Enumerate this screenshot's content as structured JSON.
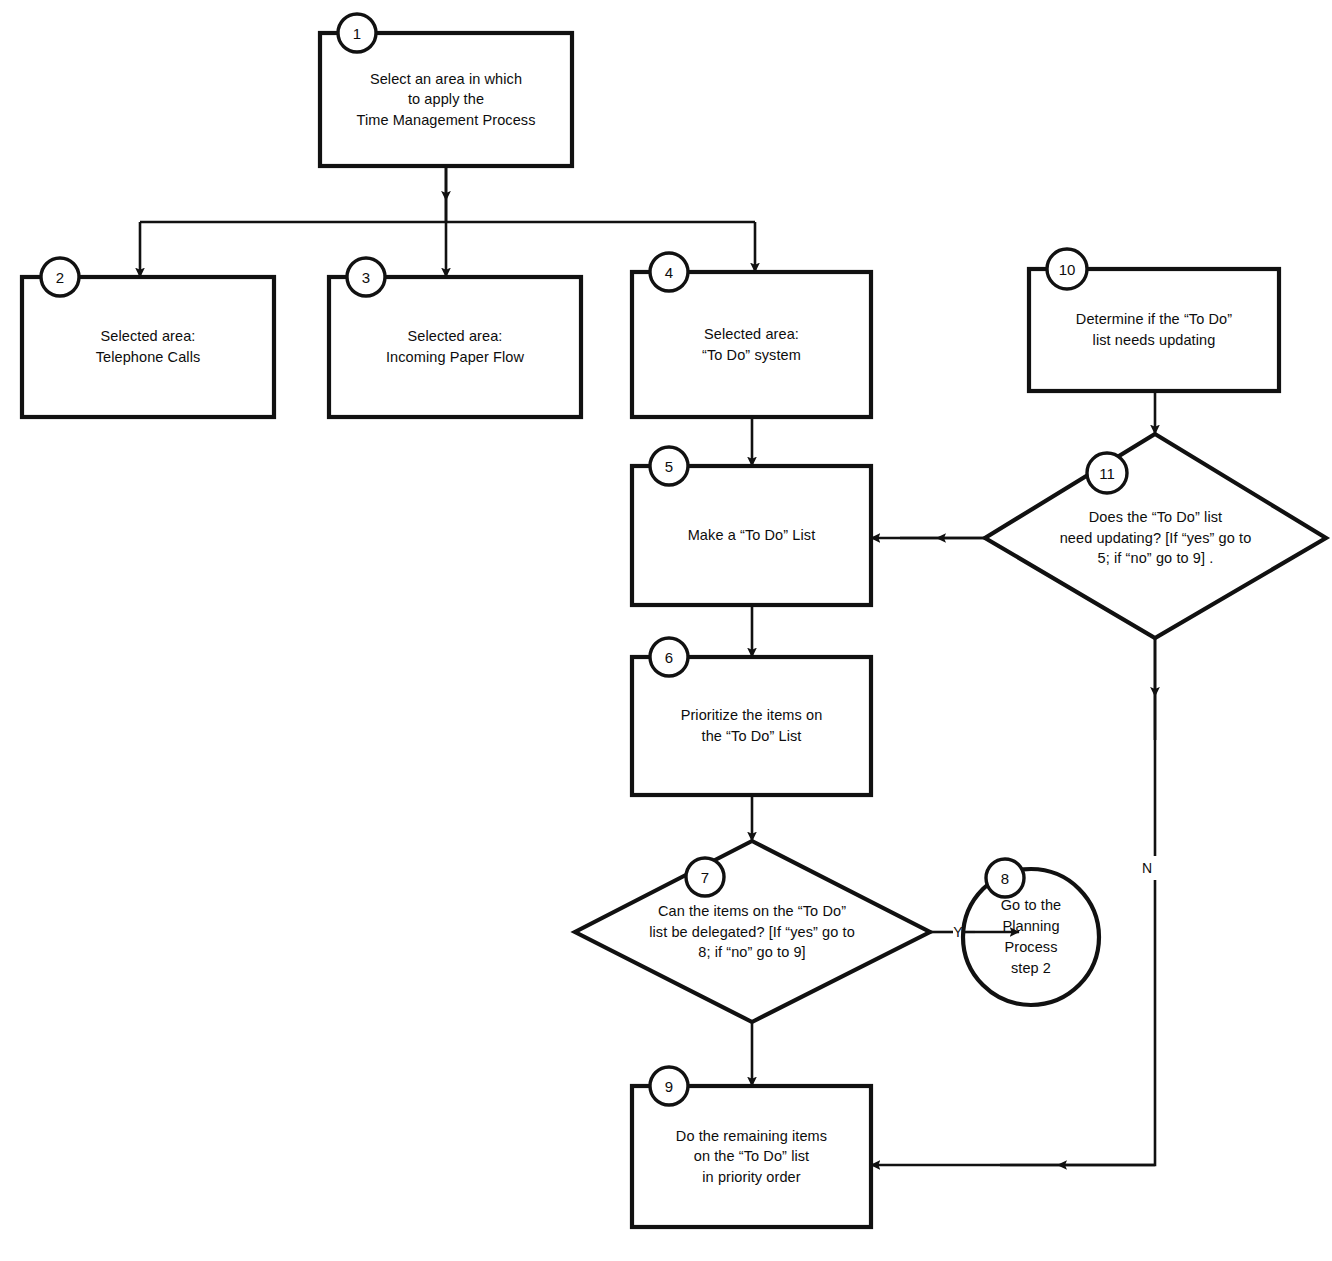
{
  "diagram": {
    "colors": {
      "stroke": "#111111",
      "background": "#ffffff",
      "text": "#0d0d0d"
    },
    "nodes": [
      {
        "id": "1",
        "badge": "1",
        "shape": "rectangle",
        "text": "Select an area in which\nto apply the\nTime Management Process"
      },
      {
        "id": "2",
        "badge": "2",
        "shape": "rectangle",
        "text": "Selected area:\nTelephone Calls"
      },
      {
        "id": "3",
        "badge": "3",
        "shape": "rectangle",
        "text": "Selected area:\nIncoming Paper Flow"
      },
      {
        "id": "4",
        "badge": "4",
        "shape": "rectangle",
        "text": "Selected area:\n“To Do” system"
      },
      {
        "id": "5",
        "badge": "5",
        "shape": "rectangle",
        "text": "Make a “To Do” List"
      },
      {
        "id": "6",
        "badge": "6",
        "shape": "rectangle",
        "text": "Prioritize the items on\nthe “To Do” List"
      },
      {
        "id": "7",
        "badge": "7",
        "shape": "diamond",
        "text": "Can the items on the “To Do”\nlist be delegated? [If “yes” go to\n8; if “no” go to 9]"
      },
      {
        "id": "8",
        "badge": "8",
        "shape": "circle",
        "text": "Go to the\nPlanning\nProcess\nstep 2"
      },
      {
        "id": "9",
        "badge": "9",
        "shape": "rectangle",
        "text": "Do the remaining items\non the “To Do” list\nin priority order"
      },
      {
        "id": "10",
        "badge": "10",
        "shape": "rectangle",
        "text": "Determine if the “To Do”\nlist needs updating"
      },
      {
        "id": "11",
        "badge": "11",
        "shape": "diamond",
        "text": "Does the “To Do” list\nneed updating? [If “yes” go to\n5; if “no” go to 9]    ."
      }
    ],
    "edge_labels": [
      {
        "id": "yes-7-to-8",
        "text": "Y"
      },
      {
        "id": "no-11-to-9",
        "text": "N"
      }
    ]
  }
}
